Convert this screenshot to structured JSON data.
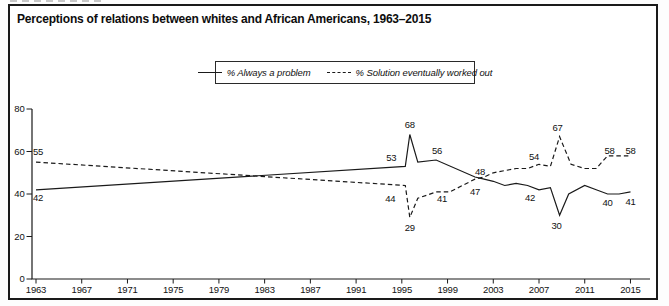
{
  "figure": {
    "title": "Perceptions of relations between whites and African Americans, 1963–2015"
  },
  "legend": {
    "items": [
      {
        "label": "% Always a problem",
        "line_style": "solid"
      },
      {
        "label": "% Solution eventually worked out",
        "line_style": "dashed"
      }
    ]
  },
  "colors": {
    "line": "#1a1a1a",
    "text": "#111111",
    "frame": "#1a1a1a",
    "background": "#ffffff"
  },
  "chart_data": {
    "type": "line",
    "title": "Perceptions of relations between whites and African Americans, 1963–2015",
    "xlabel": "",
    "ylabel": "",
    "xlim": [
      1963,
      2016.5
    ],
    "ylim": [
      0,
      80
    ],
    "y_ticks": [
      0,
      20,
      40,
      60,
      80
    ],
    "x_ticks": [
      1963,
      1967,
      1971,
      1975,
      1979,
      1983,
      1987,
      1991,
      1995,
      1999,
      2003,
      2007,
      2011,
      2015
    ],
    "grid": false,
    "legend_position": "top-center",
    "series": [
      {
        "name": "% Always a problem",
        "style": "solid",
        "points": [
          [
            1963,
            42
          ],
          [
            1995.3,
            53
          ],
          [
            1995.7,
            68
          ],
          [
            1996.4,
            55
          ],
          [
            1998,
            56
          ],
          [
            2001.4,
            48
          ],
          [
            2002.2,
            47
          ],
          [
            2003,
            46
          ],
          [
            2004,
            44
          ],
          [
            2005,
            45
          ],
          [
            2006,
            44
          ],
          [
            2007,
            42
          ],
          [
            2008,
            43
          ],
          [
            2008.8,
            30
          ],
          [
            2009.6,
            40
          ],
          [
            2011,
            44
          ],
          [
            2012,
            42
          ],
          [
            2013,
            40
          ],
          [
            2014,
            40
          ],
          [
            2015,
            41
          ]
        ]
      },
      {
        "name": "% Solution eventually worked out",
        "style": "dashed",
        "points": [
          [
            1963,
            55
          ],
          [
            1995.3,
            44
          ],
          [
            1995.7,
            29
          ],
          [
            1996.4,
            38
          ],
          [
            1998,
            41
          ],
          [
            1999.2,
            41
          ],
          [
            2001.4,
            47
          ],
          [
            2002.2,
            48
          ],
          [
            2003,
            50
          ],
          [
            2004,
            51
          ],
          [
            2005,
            52
          ],
          [
            2006,
            52
          ],
          [
            2007,
            54
          ],
          [
            2008,
            53
          ],
          [
            2008.8,
            67
          ],
          [
            2009.8,
            54
          ],
          [
            2011,
            52
          ],
          [
            2012,
            52
          ],
          [
            2013,
            58
          ],
          [
            2014,
            58
          ],
          [
            2015,
            58
          ]
        ]
      }
    ],
    "point_labels": [
      {
        "text": "55",
        "series": 1,
        "year": 1963,
        "value": 55,
        "dx": 2,
        "dy": -10
      },
      {
        "text": "42",
        "series": 0,
        "year": 1963,
        "value": 42,
        "dx": 2,
        "dy": 8
      },
      {
        "text": "53",
        "series": 0,
        "year": 1995.3,
        "value": 53,
        "dx": -14,
        "dy": -9
      },
      {
        "text": "44",
        "series": 1,
        "year": 1995.3,
        "value": 44,
        "dx": -15,
        "dy": 13
      },
      {
        "text": "68",
        "series": 0,
        "year": 1995.7,
        "value": 68,
        "dx": 0,
        "dy": -10
      },
      {
        "text": "29",
        "series": 1,
        "year": 1995.7,
        "value": 29,
        "dx": 0,
        "dy": 10
      },
      {
        "text": "56",
        "series": 0,
        "year": 1998,
        "value": 56,
        "dx": 1,
        "dy": -9
      },
      {
        "text": "41",
        "series": 1,
        "year": 1998,
        "value": 41,
        "dx": 6,
        "dy": 7
      },
      {
        "text": "48",
        "series": 0,
        "year": 2001.4,
        "value": 48,
        "dx": 5,
        "dy": -5
      },
      {
        "text": "47",
        "series": 1,
        "year": 2001.4,
        "value": 47,
        "dx": 0,
        "dy": 13
      },
      {
        "text": "54",
        "series": 1,
        "year": 2007,
        "value": 54,
        "dx": -5,
        "dy": -8
      },
      {
        "text": "42",
        "series": 0,
        "year": 2007,
        "value": 42,
        "dx": -9,
        "dy": 8
      },
      {
        "text": "67",
        "series": 1,
        "year": 2008.8,
        "value": 67,
        "dx": -2,
        "dy": -9
      },
      {
        "text": "30",
        "series": 0,
        "year": 2008.8,
        "value": 30,
        "dx": -3,
        "dy": 10
      },
      {
        "text": "58",
        "series": 1,
        "year": 2013,
        "value": 58,
        "dx": 2,
        "dy": -5
      },
      {
        "text": "58",
        "series": 1,
        "year": 2015,
        "value": 58,
        "dx": 0,
        "dy": -5
      },
      {
        "text": "40",
        "series": 0,
        "year": 2013,
        "value": 40,
        "dx": 0,
        "dy": 9
      },
      {
        "text": "41",
        "series": 0,
        "year": 2015,
        "value": 41,
        "dx": 0,
        "dy": 10
      }
    ]
  }
}
